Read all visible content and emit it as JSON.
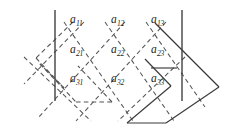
{
  "figure": {
    "kind": "matrix-lattice-diagram",
    "width": 230,
    "height": 128,
    "background_color": "#ffffff",
    "line_color": "#3a3a3a",
    "dashed_line_color": "#555555",
    "text_color": "#262626"
  },
  "matrix": {
    "rows": 3,
    "cols": 3,
    "entries": [
      [
        {
          "text": "a",
          "sub": "11"
        },
        {
          "text": "a",
          "sub": "12"
        },
        {
          "text": "a",
          "sub": "13"
        }
      ],
      [
        {
          "text": "a",
          "sub": "21"
        },
        {
          "text": "a",
          "sub": "22"
        },
        {
          "text": "a",
          "sub": "23"
        }
      ],
      [
        {
          "text": "a",
          "sub": "31"
        },
        {
          "text": "a",
          "sub": "32"
        },
        {
          "text": "a",
          "sub": "33"
        }
      ]
    ],
    "label_positions": [
      [
        {
          "x": 70,
          "y": 14
        },
        {
          "x": 111,
          "y": 14
        },
        {
          "x": 151,
          "y": 14
        }
      ],
      [
        {
          "x": 70,
          "y": 44
        },
        {
          "x": 111,
          "y": 44
        },
        {
          "x": 151,
          "y": 44
        }
      ],
      [
        {
          "x": 70,
          "y": 73
        },
        {
          "x": 111,
          "y": 73
        },
        {
          "x": 151,
          "y": 73
        }
      ]
    ]
  },
  "strokes": {
    "vertical_lines": [
      {
        "name": "left-vertical-line",
        "x1": 55,
        "y1": 10,
        "x2": 55,
        "y2": 101,
        "style": "solid"
      },
      {
        "name": "right-vertical-line",
        "x1": 182,
        "y1": 10,
        "x2": 182,
        "y2": 101,
        "style": "solid"
      }
    ],
    "solid_parallelogram": {
      "name": "solid-parallelogram",
      "points": "163,122 125,86 204,86 168,122",
      "style": "solid"
    },
    "dashed_parallelogram": {
      "name": "dashed-parallelogram",
      "points": "73,22 36,58 66,88 71,88",
      "style": "dashed"
    },
    "lattice": {
      "style": "dashed",
      "down_right_count": 4,
      "down_left_count": 4
    }
  },
  "caption": ""
}
